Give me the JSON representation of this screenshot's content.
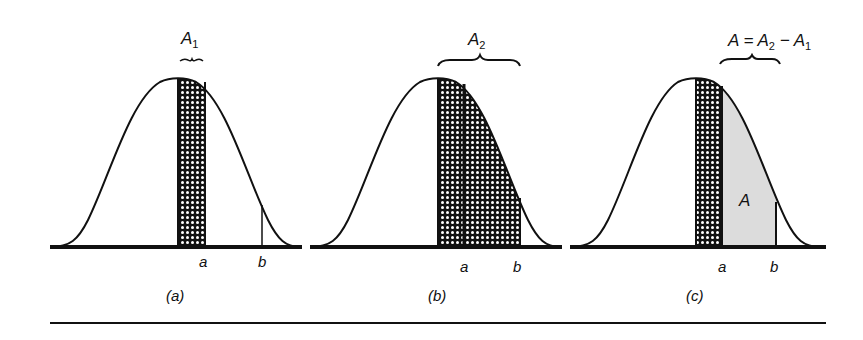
{
  "figure": {
    "panels": [
      {
        "id": "a",
        "caption": "(a)",
        "area_label": "A",
        "area_sub": "1",
        "x_label_a": "a",
        "x_label_b": "b",
        "description": "Shaded strip from mean to a"
      },
      {
        "id": "b",
        "caption": "(b)",
        "area_label": "A",
        "area_sub": "2",
        "x_label_a": "a",
        "x_label_b": "b",
        "description": "Shaded region from mean to b"
      },
      {
        "id": "c",
        "caption": "(c)",
        "area_label": "A = A",
        "area_sub": "2",
        "area_label_tail": " − A",
        "area_sub2": "1",
        "inner_label": "A",
        "x_label_a": "a",
        "x_label_b": "b",
        "description": "Gray region between a and b equals A2 minus A1"
      }
    ],
    "colors": {
      "ink": "#111111",
      "gray_fill": "#dcdcdc",
      "background": "#ffffff"
    }
  }
}
